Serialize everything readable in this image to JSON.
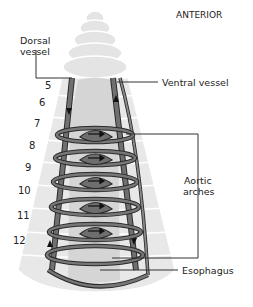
{
  "diagram": {
    "orientation_label": "ANTERIOR",
    "labels": {
      "dorsal_vessel_line1": "Dorsal",
      "dorsal_vessel_line2": "vessel",
      "ventral_vessel": "Ventral vessel",
      "aortic_arches_line1": "Aortic",
      "aortic_arches_line2": "arches",
      "esophagus": "Esophagus"
    },
    "segments": [
      "5",
      "6",
      "7",
      "8",
      "9",
      "10",
      "11",
      "12"
    ],
    "colors": {
      "body": "#e2e2e2",
      "body_outline": "#d0d0d0",
      "vessel": "#6e6e6e",
      "vessel_outline": "#2a2a2a",
      "esophagus": "#d6d6d6",
      "leader_line": "#333333"
    }
  }
}
